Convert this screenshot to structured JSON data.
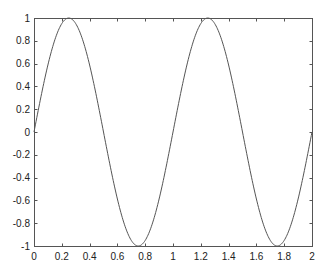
{
  "chart_data": {
    "type": "line",
    "title": "",
    "xlabel": "",
    "ylabel": "",
    "xlim": [
      0,
      2
    ],
    "ylim": [
      -1,
      1
    ],
    "grid": false,
    "box": true,
    "x_ticks": [
      0,
      0.2,
      0.4,
      0.6,
      0.8,
      1,
      1.2,
      1.4,
      1.6,
      1.8,
      2
    ],
    "x_tick_labels": [
      "0",
      "0.2",
      "0.4",
      "0.6",
      "0.8",
      "1",
      "1.2",
      "1.4",
      "1.6",
      "1.8",
      "2"
    ],
    "y_ticks": [
      -1,
      -0.8,
      -0.6,
      -0.4,
      -0.2,
      0,
      0.2,
      0.4,
      0.6,
      0.8,
      1
    ],
    "y_tick_labels": [
      "-1",
      "-0.8",
      "-0.6",
      "-0.4",
      "-0.2",
      "0",
      "0.2",
      "0.4",
      "0.6",
      "0.8",
      "1"
    ],
    "series": [
      {
        "name": "sin(2*pi*x)",
        "function": "sin(2*pi*x)",
        "color": "#555555",
        "x": [
          0,
          0.125,
          0.25,
          0.375,
          0.5,
          0.625,
          0.75,
          0.875,
          1,
          1.125,
          1.25,
          1.375,
          1.5,
          1.625,
          1.75,
          1.875,
          2
        ],
        "values": [
          0,
          0.707,
          1,
          0.707,
          0,
          -0.707,
          -1,
          -0.707,
          0,
          0.707,
          1,
          0.707,
          0,
          -0.707,
          -1,
          -0.707,
          0
        ]
      }
    ],
    "legend": null
  },
  "colors": {
    "axis": "#555555",
    "line": "#555555",
    "background": "#ffffff"
  }
}
